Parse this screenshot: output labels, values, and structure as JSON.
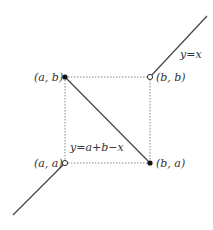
{
  "diagram": {
    "points": {
      "ab": {
        "label": "(a, b)",
        "filled": true
      },
      "bb": {
        "label": "(b, b)",
        "filled": false
      },
      "aa": {
        "label": "(a, a)",
        "filled": false
      },
      "ba": {
        "label": "(b, a)",
        "filled": true
      }
    },
    "curves": {
      "identity": {
        "label": "y=x"
      },
      "reversal": {
        "label": "y=a+b−x"
      }
    },
    "colors": {
      "line": "#444444",
      "dotted": "#888888",
      "point_fill": "#111111",
      "open_point_fill": "#ffffff"
    }
  }
}
